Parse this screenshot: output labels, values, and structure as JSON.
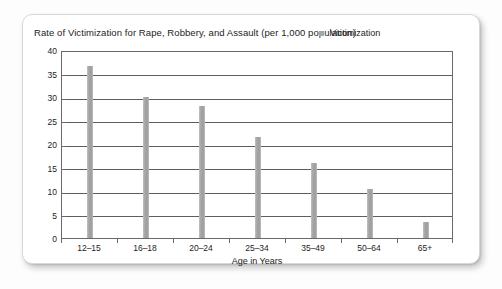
{
  "chart_data": {
    "type": "bar",
    "title": "Rate of Victimization for Rape, Robbery, and Assault (per 1,000 population)",
    "xlabel": "Age in Years",
    "ylabel": "",
    "categories": [
      "12–15",
      "16–18",
      "20–24",
      "25–34",
      "35–49",
      "50–64",
      "65+"
    ],
    "values": [
      36.5,
      30,
      28,
      21.5,
      16,
      10.5,
      3.5
    ],
    "series": [
      {
        "name": "Victimization",
        "values": [
          36.5,
          30,
          28,
          21.5,
          16,
          10.5,
          3.5
        ]
      }
    ],
    "ylim": [
      0,
      40
    ],
    "ytick_labels": [
      "0",
      "5",
      "10",
      "15",
      "20",
      "25",
      "30",
      "35",
      "40"
    ],
    "ytick_values": [
      0,
      5,
      10,
      15,
      20,
      25,
      30,
      35,
      40
    ],
    "grid": true,
    "legend": {
      "position": "top-right",
      "entries": [
        "Victimization"
      ]
    },
    "bar_color": "#a6a6a6",
    "axis_color": "#6a6a6a",
    "gridline_color": "#5e5e5e",
    "text_color": "#1c1c1c"
  }
}
